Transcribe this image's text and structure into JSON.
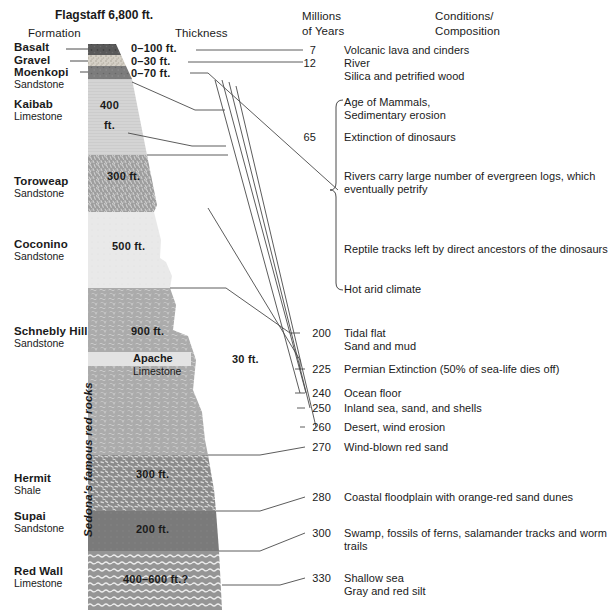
{
  "title": "Flagstaff 6,800 ft.",
  "columns": {
    "formation_header": "Formation",
    "thickness_header": "Thickness",
    "myr_header_line1": "Millions",
    "myr_header_line2": "of Years",
    "conditions_header_line1": "Conditions/",
    "conditions_header_line2": "Composition"
  },
  "side_label": "Sedona's famous red rocks",
  "formations": [
    {
      "name": "Basalt",
      "sub": "",
      "thickness": "0–100 ft.",
      "color": "#5b5b5b"
    },
    {
      "name": "Gravel",
      "sub": "",
      "thickness": "0–30 ft.",
      "color": "#cfcac2"
    },
    {
      "name": "Moenkopi",
      "sub": "Sandstone",
      "thickness": "0–70 ft.",
      "color": "#7d7d7d"
    },
    {
      "name": "Kaibab",
      "sub": "Limestone",
      "thickness": "400 ft.",
      "color": "#d2d2d2"
    },
    {
      "name": "Toroweap",
      "sub": "Sandstone",
      "thickness": "300 ft.",
      "color": "#9a9a9a"
    },
    {
      "name": "Coconino",
      "sub": "Sandstone",
      "thickness": "500 ft.",
      "color": "#e8e8e8"
    },
    {
      "name": "Schnebly Hill",
      "sub": "Sandstone",
      "thickness": "900 ft.",
      "color": "#a8a8a8"
    },
    {
      "name": "Hermit",
      "sub": "Shale",
      "thickness": "300 ft.",
      "color": "#8a8a8a"
    },
    {
      "name": "Supai",
      "sub": "Sandstone",
      "thickness": "200 ft.",
      "color": "#787878"
    },
    {
      "name": "Red Wall",
      "sub": "Limestone",
      "thickness": "400–600 ft.?",
      "color": "#949494"
    }
  ],
  "kaibab_thickness_line1": "400",
  "kaibab_thickness_line2": "ft.",
  "apache": {
    "name": "Apache",
    "sub": "Limestone",
    "thickness": "30 ft."
  },
  "timeline": [
    {
      "myr": "7",
      "text_lines": [
        "Volcanic lava and cinders"
      ]
    },
    {
      "myr": "12",
      "text_lines": [
        "River",
        "Silica and petrified wood"
      ]
    },
    {
      "myr": "",
      "text_lines": [
        "Age of Mammals,",
        "Sedimentary erosion"
      ]
    },
    {
      "myr": "65",
      "text_lines": [
        "Extinction of dinosaurs"
      ]
    },
    {
      "myr": "",
      "text_lines": [
        "Rivers carry large number of evergreen logs, which",
        "eventually petrify"
      ]
    },
    {
      "myr": "",
      "text_lines": [
        "Reptile tracks left by direct ancestors of the dinosaurs"
      ]
    },
    {
      "myr": "",
      "text_lines": [
        "Hot arid climate"
      ]
    },
    {
      "myr": "200",
      "text_lines": [
        "Tidal flat",
        "Sand and mud"
      ]
    },
    {
      "myr": "225",
      "text_lines": [
        "Permian Extinction (50% of sea-life dies off)"
      ]
    },
    {
      "myr": "240",
      "text_lines": [
        "Ocean floor"
      ]
    },
    {
      "myr": "250",
      "text_lines": [
        "Inland sea, sand, and shells"
      ]
    },
    {
      "myr": "260",
      "text_lines": [
        "Desert, wind erosion"
      ]
    },
    {
      "myr": "270",
      "text_lines": [
        "Wind-blown red sand"
      ]
    },
    {
      "myr": "280",
      "text_lines": [
        "Coastal floodplain with orange-red sand dunes"
      ]
    },
    {
      "myr": "300",
      "text_lines": [
        "Swamp, fossils of ferns, salamander tracks and worm",
        "trails"
      ]
    },
    {
      "myr": "330",
      "text_lines": [
        "Shallow sea",
        "Gray and red silt"
      ]
    }
  ],
  "colors": {
    "text": "#1a1a1a",
    "line": "#4a4a4a",
    "background": "#ffffff"
  }
}
